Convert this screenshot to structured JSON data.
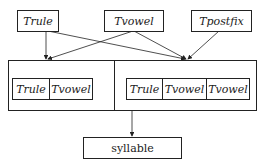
{
  "top_nodes": [
    {
      "label": "Trule"
    },
    {
      "label": "Tvowel"
    },
    {
      "label": "Tpostfix"
    }
  ],
  "left_group": {
    "cells": [
      {
        "label": "Trule"
      },
      {
        "label": "Tvowel"
      }
    ]
  },
  "right_group": {
    "cells": [
      {
        "label": "Trule"
      },
      {
        "label": "Tvowel"
      },
      {
        "label": "Tvowel"
      }
    ]
  },
  "output_node": {
    "label": "syllable"
  },
  "edges": [
    {
      "from": "Trule",
      "to": "left_group"
    },
    {
      "from": "Trule",
      "to": "right_group"
    },
    {
      "from": "Tvowel",
      "to": "left_group"
    },
    {
      "from": "Tvowel",
      "to": "right_group"
    },
    {
      "from": "Tpostfix",
      "to": "right_group"
    },
    {
      "from": "container",
      "to": "syllable"
    }
  ],
  "colors": {
    "line": "#222222",
    "background": "#ffffff"
  }
}
